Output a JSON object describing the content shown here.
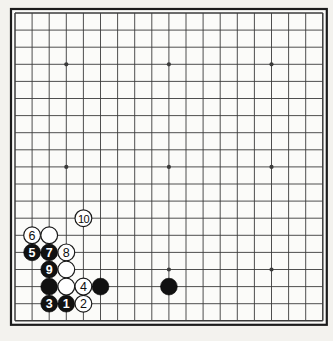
{
  "figure": {
    "kind": "go-board-diagram",
    "board_size": 19,
    "title": "",
    "background_color": "#f3f2ee",
    "board_color": "#fbfbf9",
    "line_color": "#3b3b3b",
    "border_color": "#1c1c1c",
    "black_stone_color": "#111111",
    "white_stone_color": "#ffffff",
    "black_label_color": "#ffffff",
    "white_label_color": "#0d0d0d"
  },
  "geometry": {
    "origin_x": 15,
    "origin_y": 13,
    "step": 17.1,
    "stone_radius": 8.4,
    "star_radius": 2.1
  },
  "star_points": [
    {
      "col": 3,
      "row": 3
    },
    {
      "col": 9,
      "row": 3
    },
    {
      "col": 15,
      "row": 3
    },
    {
      "col": 3,
      "row": 9
    },
    {
      "col": 9,
      "row": 9
    },
    {
      "col": 15,
      "row": 9
    },
    {
      "col": 3,
      "row": 15
    },
    {
      "col": 9,
      "row": 15
    },
    {
      "col": 15,
      "row": 15
    }
  ],
  "stones": [
    {
      "id": "stone-10",
      "color": "white",
      "label": "10",
      "col": 4,
      "row": 12
    },
    {
      "id": "stone-6",
      "color": "white",
      "label": "6",
      "col": 1,
      "row": 13
    },
    {
      "id": "stone-white-c2r13",
      "color": "white",
      "label": "",
      "col": 2,
      "row": 13
    },
    {
      "id": "stone-5",
      "color": "black",
      "label": "5",
      "col": 1,
      "row": 14
    },
    {
      "id": "stone-7",
      "color": "black",
      "label": "7",
      "col": 2,
      "row": 14
    },
    {
      "id": "stone-8",
      "color": "white",
      "label": "8",
      "col": 3,
      "row": 14
    },
    {
      "id": "stone-9",
      "color": "black",
      "label": "9",
      "col": 2,
      "row": 15
    },
    {
      "id": "stone-white-c3r15",
      "color": "white",
      "label": "",
      "col": 3,
      "row": 15
    },
    {
      "id": "stone-black-c2r16",
      "color": "black",
      "label": "",
      "col": 2,
      "row": 16
    },
    {
      "id": "stone-white-c3r16",
      "color": "white",
      "label": "",
      "col": 3,
      "row": 16
    },
    {
      "id": "stone-4",
      "color": "white",
      "label": "4",
      "col": 4,
      "row": 16
    },
    {
      "id": "stone-black-c5r16",
      "color": "black",
      "label": "",
      "col": 5,
      "row": 16
    },
    {
      "id": "stone-black-c9r16",
      "color": "black",
      "label": "",
      "col": 9,
      "row": 16
    },
    {
      "id": "stone-3",
      "color": "black",
      "label": "3",
      "col": 2,
      "row": 17
    },
    {
      "id": "stone-1",
      "color": "black",
      "label": "1",
      "col": 3,
      "row": 17
    },
    {
      "id": "stone-2",
      "color": "white",
      "label": "2",
      "col": 4,
      "row": 17
    }
  ],
  "move_sequence": [
    {
      "move": "1",
      "color": "black"
    },
    {
      "move": "2",
      "color": "white"
    },
    {
      "move": "3",
      "color": "black"
    },
    {
      "move": "4",
      "color": "white"
    },
    {
      "move": "5",
      "color": "black"
    },
    {
      "move": "6",
      "color": "white"
    },
    {
      "move": "7",
      "color": "black"
    },
    {
      "move": "8",
      "color": "white"
    },
    {
      "move": "9",
      "color": "black"
    },
    {
      "move": "10",
      "color": "white"
    }
  ]
}
